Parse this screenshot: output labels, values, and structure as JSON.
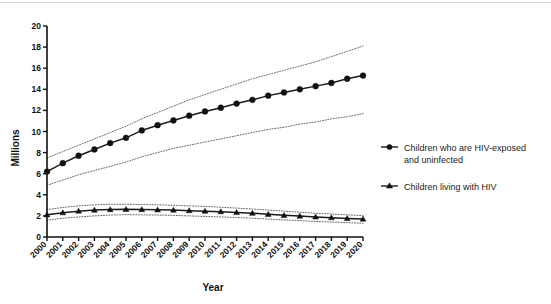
{
  "chart_data": {
    "type": "line",
    "title": "",
    "xlabel": "Year",
    "ylabel": "Millions",
    "xlim": [
      2000,
      2020
    ],
    "ylim": [
      0,
      20
    ],
    "ytick_step": 2,
    "grid": false,
    "legend_position": "right",
    "categories": [
      2000,
      2001,
      2002,
      2003,
      2004,
      2005,
      2006,
      2007,
      2008,
      2009,
      2010,
      2011,
      2012,
      2013,
      2014,
      2015,
      2016,
      2017,
      2018,
      2019,
      2020
    ],
    "x": [
      "2000",
      "2001",
      "2002",
      "2003",
      "2004",
      "2005",
      "2006",
      "2007",
      "2008",
      "2009",
      "2010",
      "2011",
      "2012",
      "2013",
      "2014",
      "2015",
      "2016",
      "2017",
      "2018",
      "2019",
      "2020"
    ],
    "yticks": [
      "0",
      "2",
      "4",
      "6",
      "8",
      "10",
      "12",
      "14",
      "16",
      "18",
      "20"
    ],
    "series": [
      {
        "name": "Children who are HIV-exposed and uninfected",
        "marker": "circle",
        "values": [
          6.2,
          7.0,
          7.7,
          8.3,
          8.9,
          9.4,
          10.1,
          10.6,
          11.05,
          11.5,
          11.9,
          12.25,
          12.65,
          13.0,
          13.4,
          13.7,
          14.0,
          14.3,
          14.6,
          15.0,
          15.3
        ],
        "ci_upper": [
          7.5,
          8.1,
          8.7,
          9.3,
          9.9,
          10.5,
          11.2,
          11.8,
          12.4,
          13.0,
          13.5,
          14.0,
          14.5,
          15.0,
          15.4,
          15.8,
          16.2,
          16.6,
          17.1,
          17.6,
          18.1
        ],
        "ci_lower": [
          4.9,
          5.4,
          5.9,
          6.3,
          6.7,
          7.1,
          7.6,
          8.0,
          8.4,
          8.7,
          9.0,
          9.3,
          9.6,
          9.9,
          10.2,
          10.4,
          10.7,
          10.9,
          11.2,
          11.4,
          11.7
        ]
      },
      {
        "name": "Children living with HIV",
        "marker": "triangle",
        "values": [
          2.1,
          2.3,
          2.45,
          2.55,
          2.6,
          2.62,
          2.6,
          2.58,
          2.55,
          2.5,
          2.45,
          2.4,
          2.32,
          2.25,
          2.15,
          2.05,
          1.98,
          1.9,
          1.83,
          1.76,
          1.7
        ],
        "ci_upper": [
          2.6,
          2.8,
          2.95,
          3.05,
          3.1,
          3.1,
          3.08,
          3.05,
          3.0,
          2.95,
          2.9,
          2.82,
          2.74,
          2.65,
          2.55,
          2.45,
          2.35,
          2.25,
          2.18,
          2.1,
          2.02
        ],
        "ci_lower": [
          1.6,
          1.78,
          1.9,
          2.0,
          2.08,
          2.12,
          2.1,
          2.08,
          2.05,
          2.0,
          1.95,
          1.9,
          1.85,
          1.78,
          1.7,
          1.62,
          1.55,
          1.48,
          1.42,
          1.36,
          1.3
        ]
      }
    ]
  },
  "legend": {
    "items": [
      {
        "label_line1": "Children who are HIV-exposed",
        "label_line2": "and uninfected",
        "marker": "circle"
      },
      {
        "label_line1": "Children living with HIV",
        "label_line2": "",
        "marker": "triangle"
      }
    ]
  },
  "axes": {
    "y_title": "Millions",
    "x_title": "Year"
  }
}
